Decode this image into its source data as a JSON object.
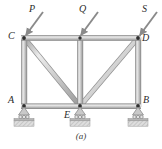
{
  "figure": {
    "caption": "(a)",
    "background_color": "#ffffff",
    "member_fill_light": "#e8e8e8",
    "member_fill_mid": "#c4c4c4",
    "member_edge": "#8d8d8d",
    "line_color": "#6f6f6f",
    "label_color": "#2b2b2b",
    "arrow_color": "#8a8a8a",
    "ground_hatch_color": "#b9b9b9"
  },
  "joints": [
    {
      "id": "C",
      "label": "C",
      "x": 24,
      "y": 38,
      "label_x": 8,
      "label_y": 31
    },
    {
      "id": "T",
      "label": "",
      "x": 80,
      "y": 38,
      "label_x": 0,
      "label_y": 0
    },
    {
      "id": "D",
      "label": "D",
      "x": 138,
      "y": 38,
      "label_x": 142,
      "label_y": 34
    },
    {
      "id": "A",
      "label": "A",
      "x": 24,
      "y": 106,
      "label_x": 8,
      "label_y": 96
    },
    {
      "id": "E",
      "label": "E",
      "x": 80,
      "y": 106,
      "label_x": 65,
      "label_y": 110
    },
    {
      "id": "B",
      "label": "B",
      "x": 138,
      "y": 106,
      "label_x": 143,
      "label_y": 96
    }
  ],
  "members": [
    {
      "name": "top-chord-C-T",
      "from": "C",
      "to": "T"
    },
    {
      "name": "top-chord-T-D",
      "from": "T",
      "to": "D"
    },
    {
      "name": "bottom-chord-A-E",
      "from": "A",
      "to": "E"
    },
    {
      "name": "bottom-chord-E-B",
      "from": "E",
      "to": "B"
    },
    {
      "name": "left-post-C-A",
      "from": "C",
      "to": "A"
    },
    {
      "name": "center-post-T-E",
      "from": "T",
      "to": "E"
    },
    {
      "name": "right-post-D-B",
      "from": "D",
      "to": "B"
    },
    {
      "name": "diagonal-C-E",
      "from": "C",
      "to": "E"
    },
    {
      "name": "diagonal-E-D",
      "from": "E",
      "to": "D"
    }
  ],
  "loads": [
    {
      "id": "P",
      "label": "P",
      "tail_x": 43,
      "tail_y": 12,
      "head_x": 25,
      "head_y": 36,
      "label_x": 29,
      "label_y": 6
    },
    {
      "id": "Q",
      "label": "Q",
      "tail_x": 98,
      "tail_y": 12,
      "head_x": 80,
      "head_y": 36,
      "label_x": 79,
      "label_y": 6
    },
    {
      "id": "S",
      "label": "S",
      "tail_x": 157,
      "tail_y": 12,
      "head_x": 139,
      "head_y": 36,
      "label_x": 142,
      "label_y": 6
    }
  ],
  "supports": [
    {
      "at": "A",
      "x": 24,
      "y": 106,
      "type": "roller"
    },
    {
      "at": "E",
      "x": 80,
      "y": 106,
      "type": "roller"
    },
    {
      "at": "B",
      "x": 138,
      "y": 106,
      "type": "roller"
    }
  ],
  "caption_position": {
    "x": 81,
    "y": 133
  }
}
